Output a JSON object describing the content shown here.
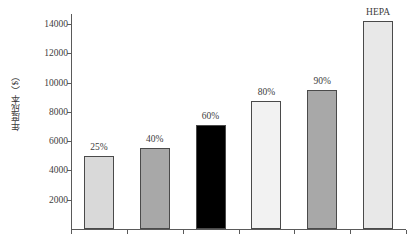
{
  "chart_data": {
    "type": "bar",
    "title": "",
    "xlabel": "",
    "ylabel": "年度成本（$）",
    "ylim": [
      0,
      15000
    ],
    "yticks": [
      2000,
      4000,
      6000,
      8000,
      10000,
      12000,
      14000
    ],
    "ytick_labels": [
      "2000",
      "4000",
      "6000",
      "8000",
      "10000",
      "12000",
      "14000"
    ],
    "grid": false,
    "legend": "none",
    "categories": [
      "25%",
      "40%",
      "60%",
      "80%",
      "90%",
      "HEPA"
    ],
    "values": [
      5000,
      5500,
      7100,
      8750,
      9500,
      14200
    ],
    "bar_colors": [
      "#d9d9d9",
      "#a8a8a8",
      "#000000",
      "#f2f2f2",
      "#a8a8a8",
      "#e8e8e8"
    ],
    "bar_edge_color": "#4a4a4a",
    "data_labels": [
      "25%",
      "40%",
      "60%",
      "80%",
      "90%",
      "HEPA"
    ],
    "axis_color": "#5a5a5a",
    "background": "#ffffff"
  }
}
